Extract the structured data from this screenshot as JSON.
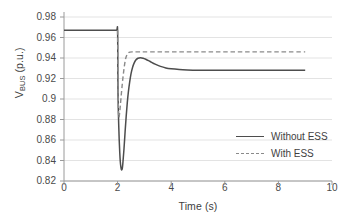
{
  "chart_data": {
    "type": "line",
    "title": "",
    "xlabel": "Time (s)",
    "ylabel": "V_BUS (p.u.)",
    "ylabel_main": "V",
    "ylabel_sub": "BUS",
    "ylabel_units": " (p.u.)",
    "xlim": [
      0,
      10
    ],
    "ylim": [
      0.82,
      0.98
    ],
    "xticks": [
      0,
      2,
      4,
      6,
      8,
      10
    ],
    "xtick_labels": [
      "0",
      "2",
      "4",
      "6",
      "8",
      "10"
    ],
    "yticks": [
      0.82,
      0.84,
      0.86,
      0.88,
      0.9,
      0.92,
      0.94,
      0.96,
      0.98
    ],
    "ytick_labels": [
      "0.82",
      "0.84",
      "0.86",
      "0.88",
      "0.9",
      "0.92",
      "0.94",
      "0.96",
      "0.98"
    ],
    "grid": "horizontal",
    "legend_position": "center-right",
    "series": [
      {
        "name": "Without ESS",
        "style": "solid",
        "color": "#4d4d4d",
        "points": [
          [
            0.0,
            0.967
          ],
          [
            1.0,
            0.967
          ],
          [
            1.8,
            0.967
          ],
          [
            1.96,
            0.967
          ],
          [
            2.0,
            0.967
          ],
          [
            2.01,
            0.92
          ],
          [
            2.02,
            0.898
          ],
          [
            2.04,
            0.876
          ],
          [
            2.06,
            0.86
          ],
          [
            2.08,
            0.848
          ],
          [
            2.1,
            0.839
          ],
          [
            2.12,
            0.834
          ],
          [
            2.14,
            0.8312
          ],
          [
            2.16,
            0.831
          ],
          [
            2.18,
            0.833
          ],
          [
            2.2,
            0.8385
          ],
          [
            2.24,
            0.852
          ],
          [
            2.28,
            0.868
          ],
          [
            2.32,
            0.883
          ],
          [
            2.36,
            0.896
          ],
          [
            2.4,
            0.9065
          ],
          [
            2.45,
            0.9165
          ],
          [
            2.5,
            0.9245
          ],
          [
            2.56,
            0.931
          ],
          [
            2.62,
            0.9352
          ],
          [
            2.68,
            0.938
          ],
          [
            2.76,
            0.9398
          ],
          [
            2.85,
            0.9402
          ],
          [
            2.95,
            0.9398
          ],
          [
            3.05,
            0.9388
          ],
          [
            3.2,
            0.9368
          ],
          [
            3.4,
            0.934
          ],
          [
            3.6,
            0.9318
          ],
          [
            3.8,
            0.9303
          ],
          [
            4.0,
            0.9295
          ],
          [
            4.3,
            0.9288
          ],
          [
            4.6,
            0.9284
          ],
          [
            5.0,
            0.9281
          ],
          [
            5.5,
            0.928
          ],
          [
            6.0,
            0.928
          ],
          [
            7.0,
            0.928
          ],
          [
            8.0,
            0.928
          ],
          [
            9.0,
            0.928
          ]
        ]
      },
      {
        "name": "With ESS",
        "style": "dashed",
        "color": "#8a8a8a",
        "points": [
          [
            2.0,
            0.967
          ],
          [
            2.01,
            0.93
          ],
          [
            2.02,
            0.906
          ],
          [
            2.03,
            0.89
          ],
          [
            2.04,
            0.883
          ],
          [
            2.05,
            0.882
          ],
          [
            2.07,
            0.885
          ],
          [
            2.1,
            0.893
          ],
          [
            2.14,
            0.905
          ],
          [
            2.18,
            0.916
          ],
          [
            2.22,
            0.9255
          ],
          [
            2.26,
            0.9335
          ],
          [
            2.3,
            0.9395
          ],
          [
            2.35,
            0.9432
          ],
          [
            2.4,
            0.945
          ],
          [
            2.46,
            0.9458
          ],
          [
            2.55,
            0.946
          ],
          [
            2.7,
            0.946
          ],
          [
            3.0,
            0.946
          ],
          [
            3.5,
            0.946
          ],
          [
            4.0,
            0.946
          ],
          [
            5.0,
            0.946
          ],
          [
            6.0,
            0.946
          ],
          [
            7.0,
            0.946
          ],
          [
            8.0,
            0.946
          ],
          [
            9.0,
            0.946
          ]
        ]
      }
    ],
    "annotations": []
  },
  "legend": {
    "items": [
      {
        "label": "Without ESS",
        "style": "solid"
      },
      {
        "label": "With ESS",
        "style": "dashed"
      }
    ]
  },
  "colors": {
    "solid_series": "#4d4d4d",
    "dashed_series": "#8a8a8a",
    "grid": "#e3e3e3",
    "axis": "#9a9a9a",
    "text": "#404040",
    "background": "#ffffff"
  }
}
